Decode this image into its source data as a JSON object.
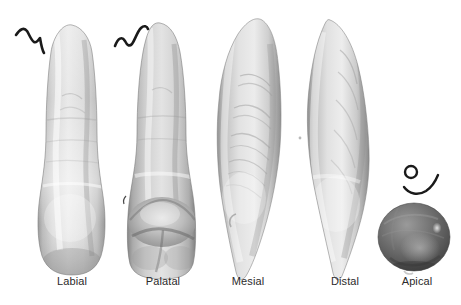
{
  "figure": {
    "kind": "dental-specimen-multiview-figure",
    "background_color": "#ffffff",
    "width": 461,
    "height": 305,
    "specimen": "maxillary incisor tooth 3D surface scan",
    "label_color": "#2b2b2b",
    "label_font_size_px": 11
  },
  "views": [
    {
      "id": "labial",
      "label": "Labial",
      "label_cx": 72,
      "label_y": 281,
      "silhouette": "long narrow crown over tapering root, rounded incisal tip at top, broad rounded cervical-to-incisal body at bottom",
      "bbox": {
        "x": 38,
        "y": 25,
        "w": 68,
        "h": 250
      },
      "tone_light": "#f2f2f2",
      "tone_mid": "#c9c9c9",
      "tone_dark": "#8d8d8d"
    },
    {
      "id": "palatal",
      "label": "Palatal",
      "label_cx": 163,
      "label_y": 281,
      "silhouette": "same outline as labial but with a prominent cingulum bulge and marginal ridge groove near the cervical third",
      "bbox": {
        "x": 126,
        "y": 23,
        "w": 72,
        "h": 256
      },
      "tone_light": "#ededed",
      "tone_mid": "#c2c2c2",
      "tone_dark": "#838383"
    },
    {
      "id": "mesial",
      "label": "Mesial",
      "label_cx": 248,
      "label_y": 281,
      "silhouette": "wedge / triangular profile, widest at the cervical third, tapering to a pointed incisal edge at bottom, with fine surface striations",
      "bbox": {
        "x": 216,
        "y": 20,
        "w": 66,
        "h": 258
      },
      "tone_light": "#f0f0f0",
      "tone_mid": "#c6c6c6",
      "tone_dark": "#8a8a8a"
    },
    {
      "id": "distal",
      "label": "Distal",
      "label_cx": 345,
      "label_y": 281,
      "silhouette": "wedge profile mirrored from mesial, broad cervical shoulder narrowing to a pointed apex at bottom",
      "bbox": {
        "x": 304,
        "y": 20,
        "w": 72,
        "h": 258
      },
      "tone_light": "#f1f1f1",
      "tone_mid": "#c7c7c7",
      "tone_dark": "#898989"
    },
    {
      "id": "apical",
      "label": "Apical",
      "label_cx": 417,
      "label_y": 281,
      "silhouette": "dark rounded ovoid cross-section viewed from the root apex, specular highlight on the right",
      "bbox": {
        "x": 378,
        "y": 203,
        "w": 72,
        "h": 68
      },
      "tone_light": "#b4b4b4",
      "tone_mid": "#6f6f6f",
      "tone_dark": "#3c3c3c"
    }
  ],
  "annotations": [
    {
      "id": "mark-labial",
      "shape": "zigzag-stroke",
      "color": "#1a1a1a",
      "near_view": "labial",
      "x": 14,
      "y": 28
    },
    {
      "id": "mark-palatal",
      "shape": "wave-stroke",
      "color": "#1a1a1a",
      "near_view": "palatal",
      "x": 113,
      "y": 24
    },
    {
      "id": "mark-apical",
      "shape": "circle-and-arc-stroke",
      "color": "#1a1a1a",
      "near_view": "apical",
      "x": 390,
      "y": 158
    }
  ]
}
